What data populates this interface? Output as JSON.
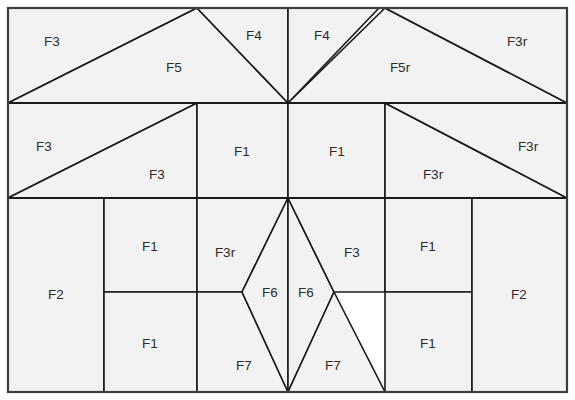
{
  "diagram": {
    "type": "quilt-block-pattern",
    "canvas": {
      "width": 575,
      "height": 400
    },
    "colors": {
      "piece_fill": "#f2f2f2",
      "piece_stroke": "#1a1a1a",
      "frame_stroke": "#3d3d3d",
      "label_text": "#2b2b2b",
      "background": "#ffffff"
    },
    "frame": {
      "x": 8,
      "y": 8,
      "width": 559,
      "height": 384
    },
    "bands": [
      {
        "name": "top-band",
        "y_top": 8,
        "y_bottom": 103
      },
      {
        "name": "middle-band",
        "y_top": 103,
        "y_bottom": 198
      },
      {
        "name": "bottom-band",
        "y_top": 198,
        "y_bottom": 392
      }
    ],
    "center_x": 288,
    "pieces": [
      {
        "id": "top-F3-left",
        "label": "F3",
        "band": "top",
        "points": "8,8 197,8 8,103",
        "label_x": 52,
        "label_y": 42
      },
      {
        "id": "top-F5-left",
        "label": "F5",
        "band": "top",
        "points": "8,103 197,8 288,103",
        "label_x": 174,
        "label_y": 68
      },
      {
        "id": "top-F4-left",
        "label": "F4",
        "band": "top",
        "points": "197,8 288,8 288,103",
        "label_x": 254,
        "label_y": 36
      },
      {
        "id": "top-F4-right",
        "label": "F4",
        "band": "top",
        "points": "288,8 379,8 288,103",
        "label_x": 322,
        "label_y": 36
      },
      {
        "id": "top-F5r-right",
        "label": "F5r",
        "band": "top",
        "points": "288,103 385,8 567,103",
        "label_x": 400,
        "label_y": 68
      },
      {
        "id": "top-F3r-right",
        "label": "F3r",
        "band": "top",
        "points": "385,8 567,8 567,103",
        "label_x": 517,
        "label_y": 42
      },
      {
        "id": "mid-F3-left",
        "label": "F3",
        "band": "middle",
        "points": "8,103 197,103 8,198",
        "label_x": 44,
        "label_y": 147
      },
      {
        "id": "mid-F3-lower",
        "label": "F3",
        "band": "middle",
        "points": "8,198 197,103 197,198",
        "label_x": 157,
        "label_y": 175
      },
      {
        "id": "mid-F1-left",
        "label": "F1",
        "band": "middle",
        "points": "197,103 288,103 288,198 197,198",
        "label_x": 242,
        "label_y": 152
      },
      {
        "id": "mid-F1-right",
        "label": "F1",
        "band": "middle",
        "points": "288,103 385,103 385,198 288,198",
        "label_x": 337,
        "label_y": 152
      },
      {
        "id": "mid-F3r-lower",
        "label": "F3r",
        "band": "middle",
        "points": "385,103 567,198 385,198",
        "label_x": 433,
        "label_y": 175
      },
      {
        "id": "mid-F3r-right",
        "label": "F3r",
        "band": "middle",
        "points": "385,103 567,103 567,198",
        "label_x": 528,
        "label_y": 147
      },
      {
        "id": "bot-F2-left",
        "label": "F2",
        "band": "bottom",
        "points": "8,198 104,198 104,392 8,392",
        "label_x": 56,
        "label_y": 295
      },
      {
        "id": "bot-F1-left-top",
        "label": "F1",
        "band": "bottom",
        "points": "104,198 197,198 197,292 104,292",
        "label_x": 150,
        "label_y": 247
      },
      {
        "id": "bot-F1-left-bot",
        "label": "F1",
        "band": "bottom",
        "points": "104,292 197,292 197,392 104,392",
        "label_x": 150,
        "label_y": 344
      },
      {
        "id": "bot-F3r-inner",
        "label": "F3r",
        "band": "bottom",
        "points": "197,198 288,198 242,292 197,292",
        "label_x": 225,
        "label_y": 253
      },
      {
        "id": "bot-F7-left",
        "label": "F7",
        "band": "bottom",
        "points": "197,292 242,292 288,392 197,392",
        "label_x": 244,
        "label_y": 366
      },
      {
        "id": "bot-F6-left",
        "label": "F6",
        "band": "bottom",
        "points": "288,198 288,392 242,292",
        "label_x": 270,
        "label_y": 293
      },
      {
        "id": "bot-F6-right",
        "label": "F6",
        "band": "bottom",
        "points": "288,198 334,292 288,392",
        "label_x": 306,
        "label_y": 293
      },
      {
        "id": "bot-F7-right",
        "label": "F7",
        "band": "bottom",
        "points": "334,292 385,392 288,392",
        "label_x": 333,
        "label_y": 366
      },
      {
        "id": "bot-F3-inner",
        "label": "F3",
        "band": "bottom",
        "points": "288,198 385,198 385,292 334,292",
        "label_x": 352,
        "label_y": 253
      },
      {
        "id": "bot-F1-right-top",
        "label": "F1",
        "band": "bottom",
        "points": "385,198 472,198 472,292 385,292",
        "label_x": 428,
        "label_y": 247
      },
      {
        "id": "bot-F1-right-bot",
        "label": "F1",
        "band": "bottom",
        "points": "385,292 472,292 472,392 385,392",
        "label_x": 428,
        "label_y": 344
      },
      {
        "id": "bot-F2-right",
        "label": "F2",
        "band": "bottom",
        "points": "472,198 567,198 567,392 472,392",
        "label_x": 519,
        "label_y": 295
      }
    ],
    "band_divider_lines": [
      {
        "id": "divider-top-middle",
        "x1": 8,
        "y1": 103,
        "x2": 567,
        "y2": 103
      },
      {
        "id": "divider-middle-bottom",
        "x1": 8,
        "y1": 198,
        "x2": 567,
        "y2": 198
      }
    ]
  }
}
